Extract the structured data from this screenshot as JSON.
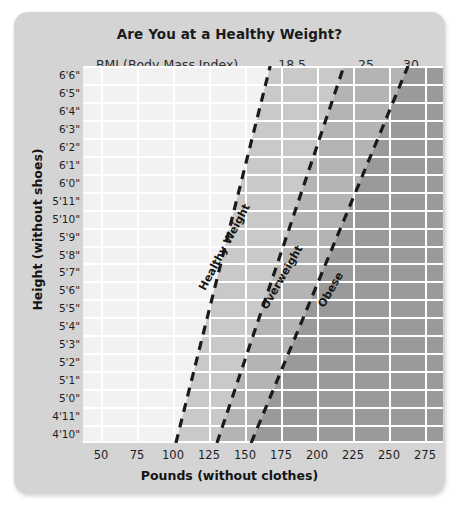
{
  "card": {
    "title": "Are You at a Healthy Weight?",
    "bmi_caption": "BMI (Body Mass Index)"
  },
  "axes": {
    "x_title": "Pounds (without clothes)",
    "y_title": "Height (without shoes)"
  },
  "chart_data": {
    "type": "area",
    "title": "Are You at a Healthy Weight?",
    "xlabel": "Pounds (without clothes)",
    "ylabel": "Height (without shoes)",
    "grid": true,
    "legend_position": "none",
    "xlim": [
      37.5,
      287.5
    ],
    "x_ticks": [
      50,
      75,
      100,
      125,
      150,
      175,
      200,
      225,
      250,
      275
    ],
    "x_tick_labels": [
      "50",
      "75",
      "100",
      "125",
      "150",
      "175",
      "200",
      "225",
      "250",
      "275"
    ],
    "y_ticks": [
      "4'10\"",
      "4'11\"",
      "5'0\"",
      "5'1\"",
      "5'2\"",
      "5'3\"",
      "5'4\"",
      "5'5\"",
      "5'6\"",
      "5'7\"",
      "5'8\"",
      "5'9\"",
      "5'10\"",
      "5'11\"",
      "6'0\"",
      "6'1\"",
      "6'2\"",
      "6'3\"",
      "6'4\"",
      "6'5\"",
      "6'6\""
    ],
    "y_tick_labels_top_down": [
      "6'6\"",
      "6'5\"",
      "6'4\"",
      "6'3\"",
      "6'2\"",
      "6'1\"",
      "6'0\"",
      "5'11\"",
      "5'10\"",
      "5'9\"",
      "5'8\"",
      "5'7\"",
      "5'6\"",
      "5'5\"",
      "5'4\"",
      "5'3\"",
      "5'2\"",
      "5'1\"",
      "5'0\"",
      "4'11\"",
      "4'10\""
    ],
    "bmi_markers": [
      {
        "label": "18.5",
        "value": 18.5,
        "x_pct": 58.1
      },
      {
        "label": "25",
        "value": 25,
        "x_pct": 78.6
      },
      {
        "label": "30",
        "value": 30,
        "x_pct": 91.1
      }
    ],
    "zones": [
      {
        "name": "Underweight",
        "bmi_range": "< 18.5",
        "color": "#f2f2f2",
        "labeled": false
      },
      {
        "name": "Healthy Weight",
        "bmi_range": "18.5 - 24.9",
        "color": "#c9c9c9",
        "labeled": true
      },
      {
        "name": "Overweight",
        "bmi_range": "25 - 29.9",
        "color": "#b4b4b4",
        "labeled": true
      },
      {
        "name": "Obese",
        "bmi_range": "30+",
        "color": "#9a9a9a",
        "labeled": true
      }
    ],
    "divider_lines": [
      {
        "bmi": 18.5,
        "label": "Healthy Weight",
        "style": "dashed",
        "color": "#1a1a1a",
        "bottom_point": {
          "x_pct": 25.8,
          "y_pct": 100
        },
        "top_point": {
          "x_pct": 52.0,
          "y_pct": 0
        }
      },
      {
        "bmi": 25,
        "label": "Overweight",
        "style": "dashed",
        "color": "#1a1a1a",
        "bottom_point": {
          "x_pct": 37.2,
          "y_pct": 100
        },
        "top_point": {
          "x_pct": 72.5,
          "y_pct": 0
        }
      },
      {
        "bmi": 30,
        "label": "Obese",
        "style": "dashed",
        "color": "#1a1a1a",
        "bottom_point": {
          "x_pct": 46.7,
          "y_pct": 100
        },
        "top_point": {
          "x_pct": 90.3,
          "y_pct": 0
        }
      }
    ],
    "band_labels": [
      {
        "text": "Healthy Weight",
        "left_pct": 33.0,
        "top_pct": 57.5,
        "rotate_deg": -62
      },
      {
        "text": "Overweight",
        "left_pct": 50.2,
        "top_pct": 62.5,
        "rotate_deg": -60
      },
      {
        "text": "Obese",
        "left_pct": 66.0,
        "top_pct": 62.0,
        "rotate_deg": -60
      }
    ]
  }
}
